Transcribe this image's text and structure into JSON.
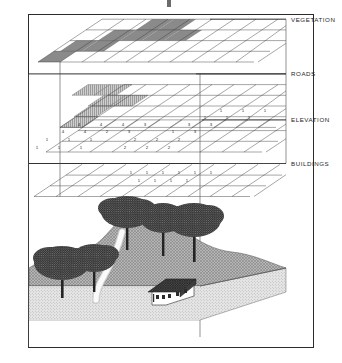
{
  "figure": {
    "frame_color": "#2c2c2c",
    "background": "#ffffff"
  },
  "layers": [
    {
      "id": "vegetation",
      "label": "VEGETATION",
      "order": 1,
      "fill_style": "solid-dark-gray",
      "fill_color": "#8a8a8a",
      "cell_value": "1",
      "shaded_cells": [
        {
          "col": 1,
          "row": 2
        },
        {
          "col": 2,
          "row": 2
        },
        {
          "col": 2,
          "row": 1
        },
        {
          "col": 3,
          "row": 1
        },
        {
          "col": 3,
          "row": 0
        },
        {
          "col": 4,
          "row": 0
        },
        {
          "col": 4,
          "row": 1
        },
        {
          "col": 5,
          "row": 1
        },
        {
          "col": 0,
          "row": 2
        },
        {
          "col": 5,
          "row": 0
        }
      ]
    },
    {
      "id": "roads",
      "label": "ROADS",
      "order": 2,
      "fill_style": "vertical-hatch-light",
      "fill_color": "#bdbdbd",
      "cell_value": "1",
      "shaded_cells": [
        {
          "col": 1,
          "row": 0
        },
        {
          "col": 2,
          "row": 0
        },
        {
          "col": 3,
          "row": 0
        },
        {
          "col": 2,
          "row": 1
        },
        {
          "col": 3,
          "row": 1
        },
        {
          "col": 2,
          "row": 2
        },
        {
          "col": 1,
          "row": 3
        },
        {
          "col": 2,
          "row": 3
        }
      ]
    },
    {
      "id": "elevation",
      "label": "ELEVATION",
      "order": 3,
      "fill_style": "numeric-grid",
      "fill_color": "#ffffff",
      "grid_values": [
        [
          "",
          "",
          "",
          "",
          "",
          "",
          "1",
          "1",
          "1"
        ],
        [
          "",
          "",
          "",
          "",
          "",
          "1",
          "1",
          "1",
          ""
        ],
        [
          "",
          "4",
          "4",
          "4",
          "3",
          "3",
          "3",
          "",
          ""
        ],
        [
          "4",
          "4",
          "2",
          "3",
          "1",
          "3",
          "",
          "",
          ""
        ],
        [
          "1",
          "1",
          "1",
          "2",
          "2",
          "2",
          "",
          "",
          ""
        ],
        [
          "1",
          "1",
          "1",
          "2",
          "2",
          "2",
          "",
          "",
          ""
        ]
      ]
    },
    {
      "id": "buildings",
      "label": "BUILDINGS",
      "order": 4,
      "fill_style": "plain-grid",
      "fill_color": "#ffffff",
      "grid_values": [
        [
          "1",
          "1",
          "1",
          "1",
          "1",
          "1"
        ],
        [
          "1",
          "1",
          "1",
          "1",
          "1",
          ""
        ]
      ]
    }
  ],
  "terrain": {
    "label": "terrain-block",
    "features": [
      {
        "type": "tree",
        "count": 5
      },
      {
        "type": "road",
        "count": 1
      },
      {
        "type": "house",
        "count": 1
      },
      {
        "type": "hill",
        "count": 2
      }
    ],
    "surface_texture": "cross-hatch-gray",
    "base_texture": "stipple-dots",
    "surface_color": "#9a9a9a",
    "base_color": "#d8d8d8"
  },
  "projection": {
    "left_line_x": 60,
    "right_line_x": 200,
    "style": "vertical-drop-lines"
  }
}
